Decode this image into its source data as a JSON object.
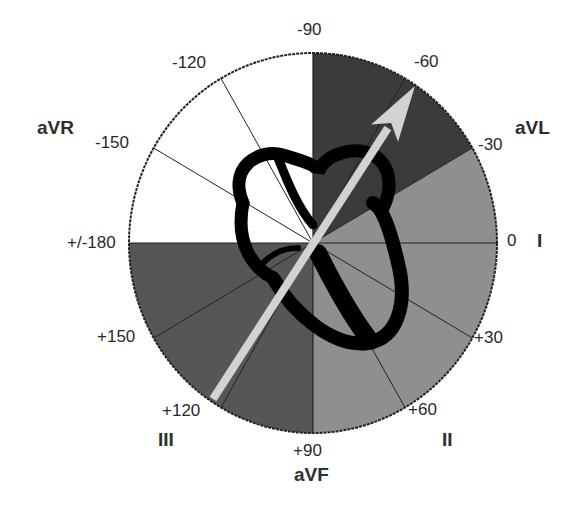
{
  "diagram": {
    "center": {
      "x": 313,
      "y": 243
    },
    "radius": {
      "rx": 184,
      "ry": 190
    },
    "colors": {
      "normal_axis": "#8f8f8f",
      "left_axis_deviation": "#3b3b3b",
      "right_axis_deviation": "#565656",
      "extreme_axis": "#ffffff",
      "outline": "#222222",
      "heart": "#000000",
      "arrow": "#d2d2d2"
    },
    "sectors": [
      {
        "name": "left-axis-deviation",
        "from_deg": -90,
        "to_deg": -30,
        "color": "#3b3b3b"
      },
      {
        "name": "normal-axis",
        "from_deg": -30,
        "to_deg": 90,
        "color": "#8f8f8f"
      },
      {
        "name": "right-axis-deviation",
        "from_deg": 90,
        "to_deg": 180,
        "color": "#565656"
      },
      {
        "name": "extreme-axis-deviation",
        "from_deg": -180,
        "to_deg": -90,
        "color": "#ffffff"
      }
    ],
    "spoke_angles": [
      -150,
      -120,
      -60,
      -30,
      30,
      60,
      120,
      150
    ],
    "degree_labels": [
      {
        "text": "-90",
        "x": 297,
        "y": 21
      },
      {
        "text": "-60",
        "x": 414,
        "y": 53
      },
      {
        "text": "-30",
        "x": 478,
        "y": 136
      },
      {
        "text": "0",
        "x": 507,
        "y": 232
      },
      {
        "text": "+30",
        "x": 474,
        "y": 329
      },
      {
        "text": "+60",
        "x": 408,
        "y": 401
      },
      {
        "text": "+90",
        "x": 293,
        "y": 442
      },
      {
        "text": "+120",
        "x": 162,
        "y": 402
      },
      {
        "text": "+150",
        "x": 97,
        "y": 328
      },
      {
        "text": "+/-180",
        "x": 67,
        "y": 234
      },
      {
        "text": "-150",
        "x": 95,
        "y": 134
      },
      {
        "text": "-120",
        "x": 172,
        "y": 54
      }
    ],
    "lead_labels": [
      {
        "text": "aVR",
        "x": 37,
        "y": 118
      },
      {
        "text": "aVL",
        "x": 515,
        "y": 118
      },
      {
        "text": "I",
        "x": 537,
        "y": 231
      },
      {
        "text": "II",
        "x": 442,
        "y": 430
      },
      {
        "text": "III",
        "x": 158,
        "y": 430
      },
      {
        "text": "aVF",
        "x": 294,
        "y": 465
      }
    ],
    "axis_arrow": {
      "label": "mean QRS axis",
      "angle_deg": -60,
      "tail": {
        "x": 213,
        "y": 399
      },
      "tip": {
        "x": 415,
        "y": 86
      }
    }
  }
}
